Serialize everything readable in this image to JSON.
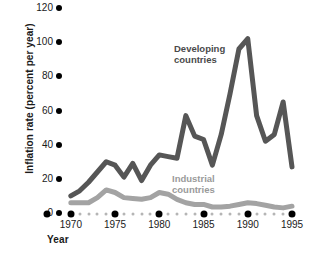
{
  "chart_data": {
    "type": "line",
    "title": "",
    "xlabel": "Year",
    "ylabel": "Inflation rate (percent per year)",
    "xlim": [
      1969,
      1995
    ],
    "ylim": [
      0,
      120
    ],
    "yticks": [
      0,
      20,
      40,
      60,
      80,
      100,
      120
    ],
    "xticks": [
      1970,
      1975,
      1980,
      1985,
      1990,
      1995
    ],
    "x_minor_ticks": [
      1971,
      1972,
      1973,
      1974,
      1976,
      1977,
      1978,
      1979,
      1981,
      1982,
      1983,
      1984,
      1986,
      1987,
      1988,
      1989,
      1991,
      1992,
      1993,
      1994
    ],
    "grid": false,
    "legend_position": "inline-annotations",
    "x": [
      1970,
      1971,
      1972,
      1973,
      1974,
      1975,
      1976,
      1977,
      1978,
      1979,
      1980,
      1981,
      1982,
      1983,
      1984,
      1985,
      1986,
      1987,
      1988,
      1989,
      1990,
      1991,
      1992,
      1993,
      1994,
      1995
    ],
    "series": [
      {
        "name": "Developing countries",
        "color": "#565656",
        "values": [
          10,
          13,
          18,
          24,
          30,
          28,
          21,
          29,
          19,
          28,
          34,
          33,
          32,
          57,
          45,
          43,
          28,
          46,
          70,
          96,
          102,
          57,
          42,
          46,
          65,
          27
        ]
      },
      {
        "name": "Industrial countries",
        "color": "#a3a3a3",
        "values": [
          6,
          6,
          6,
          9,
          13.5,
          12,
          9,
          8.5,
          8,
          9,
          12,
          11,
          8,
          6,
          5,
          5,
          3.5,
          3.5,
          4,
          5,
          6,
          5.5,
          4.5,
          3.5,
          3,
          4
        ]
      }
    ],
    "annotations": [
      {
        "text": "Developing countries",
        "color": "#4a4a4a"
      },
      {
        "text": "Industrial countries",
        "color": "#9a9a9a"
      }
    ]
  },
  "axes": {
    "y_title": "Inflation rate (percent per year)",
    "x_title": "Year",
    "y_tick_labels": [
      "120",
      "100",
      "80",
      "60",
      "40",
      "20",
      "0"
    ],
    "x_tick_labels": [
      "1970",
      "1975",
      "1980",
      "1985",
      "1990",
      "1995"
    ]
  },
  "labels": {
    "developing_line1": "Developing",
    "developing_line2": "countries",
    "industrial_line1": "Industrial",
    "industrial_line2": "countries"
  }
}
